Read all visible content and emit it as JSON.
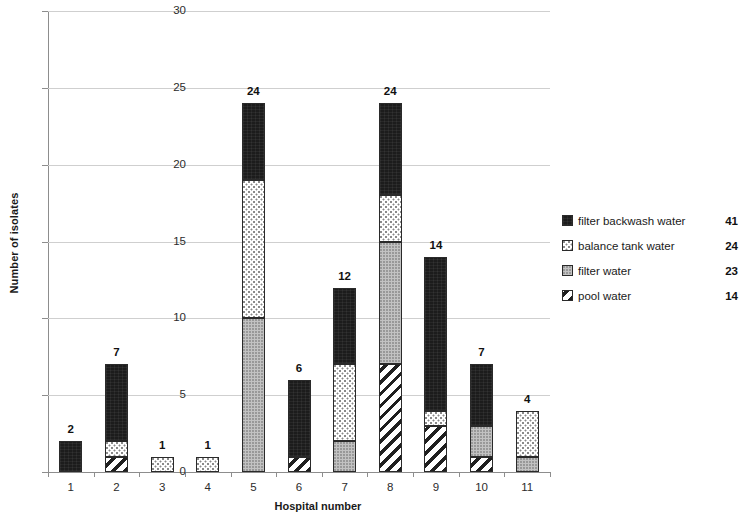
{
  "chart_data": {
    "type": "bar",
    "subtype": "stacked-bar",
    "title": "",
    "xlabel": "Hospital number",
    "ylabel": "Number of isolates",
    "categories": [
      "1",
      "2",
      "3",
      "4",
      "5",
      "6",
      "7",
      "8",
      "9",
      "10",
      "11"
    ],
    "ylim": [
      0,
      30
    ],
    "yticks": [
      0,
      5,
      10,
      15,
      20,
      25,
      30
    ],
    "grid": "horizontal",
    "legend_position": "right",
    "stack_order_bottom_to_top": [
      "pool water",
      "filter water",
      "balance tank water",
      "filter backwash water"
    ],
    "series": [
      {
        "name": "pool water",
        "total": 14,
        "pattern": "diagonal-stripes",
        "color": "#ffffff",
        "values": [
          0,
          1,
          0,
          0,
          0,
          1,
          0,
          7,
          3,
          1,
          0
        ]
      },
      {
        "name": "filter water",
        "total": 23,
        "pattern": "solid-gray",
        "color": "#c2c2c2",
        "values": [
          0,
          0,
          0,
          0,
          10,
          0,
          2,
          8,
          0,
          2,
          1
        ]
      },
      {
        "name": "balance tank water",
        "total": 24,
        "pattern": "dotted",
        "color": "#ffffff",
        "values": [
          0,
          1,
          1,
          1,
          9,
          0,
          5,
          3,
          1,
          0,
          3
        ]
      },
      {
        "name": "filter backwash water",
        "total": 41,
        "pattern": "solid-black",
        "color": "#1c1c1c",
        "values": [
          2,
          5,
          0,
          0,
          5,
          5,
          5,
          6,
          10,
          4,
          0
        ]
      }
    ],
    "totals": [
      2,
      7,
      1,
      1,
      24,
      6,
      12,
      24,
      14,
      7,
      4
    ],
    "bar_value_labels": [
      "2",
      "7",
      "1",
      "1",
      "24",
      "6",
      "12",
      "24",
      "14",
      "7",
      "4"
    ]
  },
  "legend": {
    "rows": [
      {
        "label": "filter backwash water",
        "count": "41",
        "swatch": "solid-black-swatch"
      },
      {
        "label": "balance tank water",
        "count": "24",
        "swatch": "dotted-swatch"
      },
      {
        "label": "filter water",
        "count": "23",
        "swatch": "gray-swatch"
      },
      {
        "label": "pool water",
        "count": "14",
        "swatch": "diagonal-stripes-swatch"
      }
    ]
  },
  "axes": {
    "y_title": "Number of isolates",
    "x_title": "Hospital number",
    "y_tick_labels": [
      "0",
      "5",
      "10",
      "15",
      "20",
      "25",
      "30"
    ],
    "x_tick_labels": [
      "1",
      "2",
      "3",
      "4",
      "5",
      "6",
      "7",
      "8",
      "9",
      "10",
      "11"
    ]
  }
}
